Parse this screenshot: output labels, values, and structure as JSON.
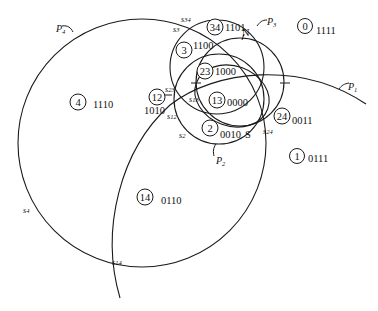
{
  "diagram": {
    "curve_labels": {
      "P1": {
        "main": "P",
        "sub": "1"
      },
      "P2": {
        "main": "P",
        "sub": "2"
      },
      "P3": {
        "main": "P",
        "sub": "3"
      },
      "P4": {
        "main": "P",
        "sub": "4"
      },
      "N": "N",
      "S": "S"
    },
    "point_labels": {
      "s34": {
        "main": "s",
        "sub": "34"
      },
      "s3": {
        "main": "s",
        "sub": "3"
      },
      "s23": {
        "main": "s",
        "sub": "23"
      },
      "s13": {
        "main": "s",
        "sub": "13"
      },
      "s12": {
        "main": "s",
        "sub": "12"
      },
      "s2": {
        "main": "s",
        "sub": "2"
      },
      "s24": {
        "main": "s",
        "sub": "24"
      },
      "s4": {
        "main": "s",
        "sub": "4"
      },
      "s14": {
        "main": "s",
        "sub": "14"
      }
    },
    "regions": [
      {
        "id": "r34",
        "number": "34",
        "code": "1101"
      },
      {
        "id": "r0",
        "number": "0",
        "code": "1111"
      },
      {
        "id": "r3",
        "number": "3",
        "code": "1100"
      },
      {
        "id": "r23",
        "number": "23",
        "code": "1000"
      },
      {
        "id": "r4",
        "number": "4",
        "code": "1110"
      },
      {
        "id": "r12",
        "number": "12",
        "code": "1010"
      },
      {
        "id": "r13",
        "number": "13",
        "code": "0000"
      },
      {
        "id": "r24",
        "number": "24",
        "code": "0011"
      },
      {
        "id": "r2",
        "number": "2",
        "code": "0010"
      },
      {
        "id": "r1",
        "number": "1",
        "code": "0111"
      },
      {
        "id": "r14",
        "number": "14",
        "code": "0110"
      }
    ]
  }
}
